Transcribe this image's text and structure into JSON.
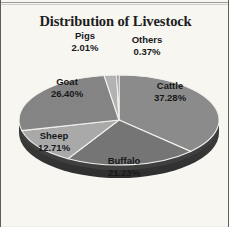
{
  "chart_data": {
    "type": "pie",
    "title": "Distribution of Livestock",
    "xlabel": "",
    "ylabel": "",
    "legend": "none",
    "grid": false,
    "three_d": true,
    "value_unit": "percent",
    "categories": [
      "Cattle",
      "Buffalo",
      "Sheep",
      "Goat",
      "Pigs",
      "Others"
    ],
    "values": [
      37.28,
      21.23,
      12.71,
      26.4,
      2.01,
      0.37
    ],
    "labels": [
      "37.28%",
      "21.23%",
      "12.71%",
      "26.40%",
      "2.01%",
      "0.37%"
    ],
    "slices": [
      {
        "name": "Cattle",
        "value": 37.28,
        "label": "37.28%",
        "color": "#8b8b8b",
        "side_color": "#3c3c3c"
      },
      {
        "name": "Buffalo",
        "value": 21.23,
        "label": "21.23%",
        "color": "#757575",
        "side_color": "#343434"
      },
      {
        "name": "Sheep",
        "value": 12.71,
        "label": "12.71%",
        "color": "#a9a9a9",
        "side_color": "#4d4d4d"
      },
      {
        "name": "Goat",
        "value": 26.4,
        "label": "26.40%",
        "color": "#848484",
        "side_color": "#3a3a3a"
      },
      {
        "name": "Pigs",
        "value": 2.01,
        "label": "2.01%",
        "color": "#b2b2b2",
        "side_color": "#545454"
      },
      {
        "name": "Others",
        "value": 0.37,
        "label": "0.37%",
        "color": "#6f6f6f",
        "side_color": "#323232"
      }
    ]
  },
  "chart": {
    "title": "Distribution of Livestock",
    "labels": {
      "cattle": {
        "name": "Cattle",
        "value": "37.28%"
      },
      "buffalo": {
        "name": "Buffalo",
        "value": "21.23%"
      },
      "sheep": {
        "name": "Sheep",
        "value": "12.71%"
      },
      "goat": {
        "name": "Goat",
        "value": "26.40%"
      },
      "pigs": {
        "name": "Pigs",
        "value": "2.01%"
      },
      "others": {
        "name": "Others",
        "value": "0.37%"
      }
    }
  },
  "colors": {
    "background": "#f7f6f1",
    "title_text": "#1d1d1d",
    "label_text": "#17181a",
    "frame": "#5d5d5d"
  }
}
